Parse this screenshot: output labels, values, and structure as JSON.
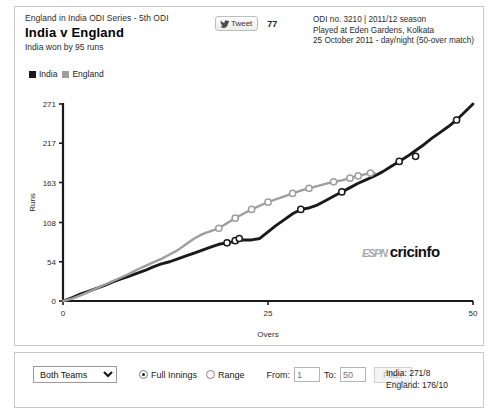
{
  "header": {
    "series": "England in India ODI Series - 5th ODI",
    "title": "India v England",
    "result": "India won by 95 runs",
    "tweet_label": "Tweet",
    "tweet_count": "77",
    "tweet_icon": "twitter-bird-icon",
    "match_info": [
      "ODI no. 3210 | 2011/12 season",
      "Played at Eden Gardens, Kolkata",
      "25 October 2011 - day/night (50-over match)"
    ]
  },
  "legend": {
    "items": [
      {
        "label": "India",
        "color": "#1a1a1a"
      },
      {
        "label": "England",
        "color": "#9e9e9e"
      }
    ]
  },
  "logo": {
    "espn": "ESPN",
    "cricinfo": "cricinfo"
  },
  "controls": {
    "team_select": {
      "value": "Both Teams",
      "options": [
        "Both Teams",
        "India",
        "England"
      ]
    },
    "innings_mode": {
      "full_label": "Full Innings",
      "range_label": "Range",
      "selected": "Full Innings"
    },
    "from_label": "From:",
    "from_value": "1",
    "to_label": "To:",
    "to_value": "50",
    "filter_label": "Filter",
    "filter_disabled": true,
    "scores": [
      "India: 271/8",
      "England: 176/10"
    ]
  },
  "chart_data": {
    "type": "line",
    "title": "India v England",
    "xlabel": "Overs",
    "ylabel": "Runs",
    "xlim": [
      0,
      50
    ],
    "ylim": [
      0,
      271
    ],
    "xticks": [
      0,
      25,
      50
    ],
    "yticks": [
      0,
      54,
      108,
      163,
      217,
      271
    ],
    "grid": false,
    "legend_position": "top-left",
    "series": [
      {
        "name": "India",
        "color": "#1a1a1a",
        "x": [
          0,
          1,
          2,
          3,
          4,
          5,
          6,
          7,
          8,
          9,
          10,
          11,
          12,
          13,
          14,
          15,
          16,
          17,
          18,
          19,
          20,
          21,
          22,
          23,
          24,
          25,
          26,
          27,
          28,
          29,
          30,
          31,
          32,
          33,
          34,
          35,
          36,
          37,
          38,
          39,
          40,
          41,
          42,
          43,
          44,
          45,
          46,
          47,
          48,
          49,
          50
        ],
        "y": [
          0,
          4,
          9,
          13,
          17,
          21,
          26,
          30,
          34,
          38,
          42,
          47,
          51,
          54,
          58,
          62,
          66,
          70,
          74,
          78,
          80,
          82,
          84,
          84,
          86,
          95,
          104,
          112,
          120,
          126,
          128,
          132,
          138,
          144,
          150,
          156,
          162,
          167,
          172,
          178,
          185,
          192,
          199,
          207,
          215,
          224,
          232,
          240,
          249,
          260,
          271
        ],
        "wickets": [
          {
            "over": 20,
            "runs": 80
          },
          {
            "over": 21,
            "runs": 83
          },
          {
            "over": 21.5,
            "runs": 86
          },
          {
            "over": 29,
            "runs": 126
          },
          {
            "over": 34,
            "runs": 150
          },
          {
            "over": 41,
            "runs": 192
          },
          {
            "over": 43,
            "runs": 199
          },
          {
            "over": 48,
            "runs": 249
          }
        ]
      },
      {
        "name": "England",
        "color": "#9e9e9e",
        "x": [
          0,
          1,
          2,
          3,
          4,
          5,
          6,
          7,
          8,
          9,
          10,
          11,
          12,
          13,
          14,
          15,
          16,
          17,
          18,
          19,
          20,
          21,
          22,
          23,
          24,
          25,
          26,
          27,
          28,
          29,
          30,
          31,
          32,
          33,
          34,
          35,
          36,
          37,
          38
        ],
        "y": [
          0,
          3,
          7,
          12,
          17,
          22,
          27,
          32,
          37,
          43,
          48,
          53,
          58,
          64,
          70,
          78,
          86,
          92,
          96,
          100,
          107,
          114,
          120,
          126,
          131,
          136,
          140,
          144,
          148,
          152,
          155,
          158,
          161,
          164,
          166,
          169,
          172,
          175,
          176
        ],
        "wickets": [
          {
            "over": 19,
            "runs": 100
          },
          {
            "over": 21,
            "runs": 114
          },
          {
            "over": 23,
            "runs": 126
          },
          {
            "over": 25,
            "runs": 136
          },
          {
            "over": 28,
            "runs": 148
          },
          {
            "over": 30,
            "runs": 155
          },
          {
            "over": 33,
            "runs": 164
          },
          {
            "over": 35,
            "runs": 169
          },
          {
            "over": 36,
            "runs": 172
          },
          {
            "over": 37.5,
            "runs": 176
          }
        ]
      }
    ]
  }
}
